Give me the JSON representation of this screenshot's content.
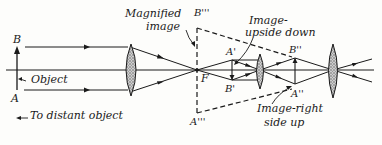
{
  "diagram": {
    "labels": {
      "B": "B",
      "A": "A",
      "object": "Object",
      "to_distant_object": "To distant object",
      "magnified_image_line1": "Magnified",
      "magnified_image_line2": "image",
      "B_triple": "B'''",
      "A_triple": "A'''",
      "F": "F",
      "A_prime": "A'",
      "B_prime": "B'",
      "image_upside_down_line1": "Image-",
      "image_upside_down_line2": "upside down",
      "B_double": "B''",
      "A_double": "A''",
      "image_right_line1": "Image-right",
      "image_right_line2": "side up"
    },
    "elements": [
      "objective-lens",
      "erecting-lens",
      "eyepiece-lens",
      "optical-axis",
      "object-arrow",
      "inverted-image-arrow",
      "erect-image-arrow",
      "virtual-magnified-image-dashed"
    ],
    "colors": {
      "ink": "#1a1a1a",
      "lens_fill": "#9a9a9a",
      "background": "#fdfdfb"
    }
  }
}
